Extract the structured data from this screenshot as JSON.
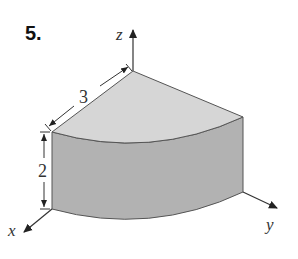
{
  "problem": {
    "number": "5."
  },
  "figure": {
    "axes": {
      "x_label": "x",
      "y_label": "y",
      "z_label": "z"
    },
    "dimensions": {
      "radius": "3",
      "height": "2"
    },
    "colors": {
      "top_face": "#d6d6d6",
      "side_face": "#b2b2b2",
      "edge": "#555555",
      "axis": "#333333"
    }
  }
}
